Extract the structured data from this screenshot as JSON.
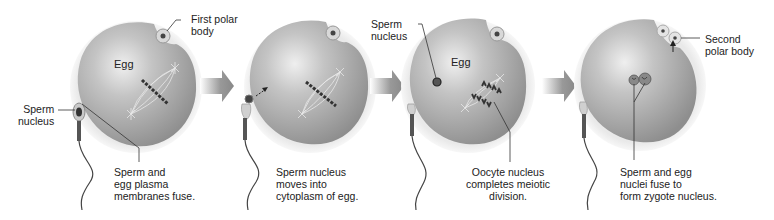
{
  "diagram": {
    "colors": {
      "egg_fill": "#9c9c9c",
      "egg_highlight": "#e4e4e4",
      "zona": "#e2e2e2",
      "arrow": "#8a8a8a",
      "chromosome": "#333333",
      "leader_line": "#333333"
    },
    "panels": [
      {
        "id": "stage-1",
        "egg_label": "Egg",
        "labels": {
          "sperm_nucleus": "Sperm\nnucleus",
          "polar_body": "First polar\nbody",
          "caption": "Sperm and\negg plasma\nmembranes fuse."
        }
      },
      {
        "id": "stage-2",
        "labels": {
          "caption": "Sperm nucleus\nmoves into\ncytoplasm of egg."
        }
      },
      {
        "id": "stage-3",
        "egg_label": "Egg",
        "labels": {
          "sperm_nucleus": "Sperm\nnucleus",
          "caption": "Oocyte nucleus\ncompletes meiotic\ndivision."
        }
      },
      {
        "id": "stage-4",
        "labels": {
          "polar_body": "Second\npolar body",
          "caption": "Sperm and egg\nnuclei fuse to\nform zygote nucleus."
        }
      }
    ],
    "arrows": [
      {
        "from": "stage-1",
        "to": "stage-2",
        "icon": "right-arrow-icon"
      },
      {
        "from": "stage-2",
        "to": "stage-3",
        "icon": "right-arrow-icon"
      },
      {
        "from": "stage-3",
        "to": "stage-4",
        "icon": "right-arrow-icon"
      }
    ]
  }
}
